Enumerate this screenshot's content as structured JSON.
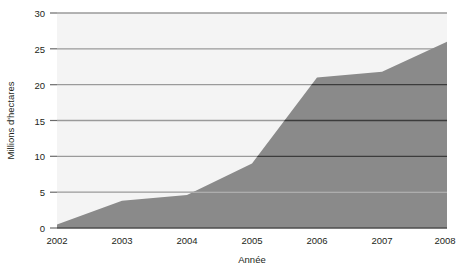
{
  "chart_data": {
    "type": "area",
    "title": "",
    "subtitle": "",
    "xlabel": "Année",
    "ylabel": "Millions d'hectares",
    "x": [
      2002,
      2003,
      2004,
      2005,
      2006,
      2007,
      2008
    ],
    "categories": [
      "2002",
      "2003",
      "2004",
      "2005",
      "2006",
      "2007",
      "2008"
    ],
    "values": [
      0.5,
      3.8,
      4.6,
      9.0,
      21.0,
      21.8,
      26.0
    ],
    "series": [
      {
        "name": "Surface cultivée",
        "values": [
          0.5,
          3.8,
          4.6,
          9.0,
          21.0,
          21.8,
          26.0
        ]
      }
    ],
    "xlim": [
      2002,
      2008
    ],
    "ylim": [
      0,
      30
    ],
    "y_ticks": [
      0,
      5,
      10,
      15,
      20,
      25,
      30
    ],
    "y_tick_labels": [
      "0",
      "5",
      "10",
      "15",
      "20",
      "25",
      "30"
    ],
    "x_ticks": [
      2002,
      2003,
      2004,
      2005,
      2006,
      2007,
      2008
    ],
    "x_tick_labels": [
      "2002",
      "2003",
      "2004",
      "2005",
      "2006",
      "2007",
      "2008"
    ],
    "grid": true,
    "grid_orientation": "horizontal",
    "legend": false,
    "legend_position": "none",
    "annotations": [],
    "colors": {
      "area_fill": "#8a8a8a",
      "plot_background": "#f4f4f4",
      "gridline": "#9a9a9a",
      "gridline_over_fill": "#3c3c3c",
      "axis_line": "#4d4d4d",
      "text": "#231f20",
      "page_background": "#ffffff"
    }
  }
}
